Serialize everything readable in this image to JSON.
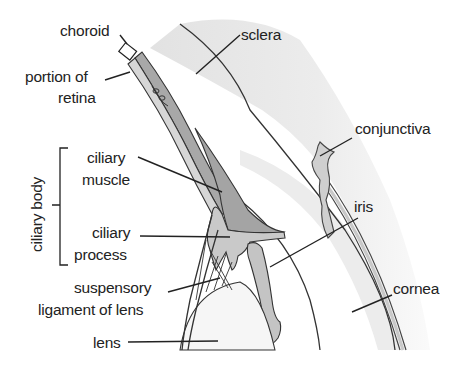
{
  "diagram": {
    "colors": {
      "background": "#ffffff",
      "sclera": "#e4e4e4",
      "cornea": "#efefef",
      "choroid_band": "#a9a9a9",
      "ciliary_muscle": "#a4a4a4",
      "ciliary_process": "#c9c9c9",
      "iris": "#c4c4c4",
      "conjunctiva": "#cfcfcf",
      "lens": "#f6f6f6",
      "lines": "#222222"
    },
    "labels": {
      "choroid": "choroid",
      "sclera": "sclera",
      "portion_of_retina_line1": "portion of",
      "portion_of_retina_line2": "retina",
      "conjunctiva": "conjunctiva",
      "ciliary_body": "ciliary body",
      "ciliary_muscle_line1": "ciliary",
      "ciliary_muscle_line2": "muscle",
      "iris": "iris",
      "ciliary_process_line1": "ciliary",
      "ciliary_process_line2": "process",
      "cornea": "cornea",
      "suspensory_line1": "suspensory",
      "suspensory_line2": "ligament of lens",
      "lens": "lens"
    }
  }
}
